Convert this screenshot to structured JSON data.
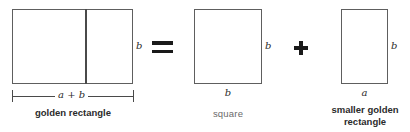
{
  "diagram": {
    "equation_operators": {
      "equals": "=",
      "plus": "+"
    },
    "stroke_color": "#5e5e5e",
    "text_color": "#2b2b2b",
    "background_color": "#ffffff",
    "figures": [
      {
        "id": "golden-rectangle",
        "caption": "golden rectangle",
        "caption_weight": "bold",
        "side_label": "b",
        "width_dimension_label": "a + b",
        "has_internal_divider": true
      },
      {
        "id": "square",
        "caption": "square",
        "caption_weight": "regular",
        "side_label": "b",
        "bottom_label": "b",
        "has_internal_divider": false
      },
      {
        "id": "smaller-golden-rectangle",
        "caption_line1": "smaller golden",
        "caption_line2": "rectangle",
        "caption_weight": "bold",
        "side_label": "b",
        "bottom_label": "a",
        "has_internal_divider": false
      }
    ]
  }
}
